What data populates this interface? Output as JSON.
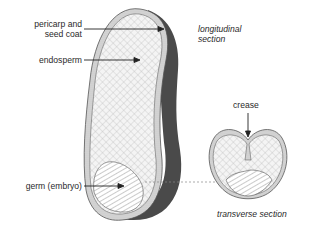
{
  "figure": {
    "labels": {
      "pericarp_line1": "pericarp and",
      "pericarp_line2": "seed coat",
      "endosperm": "endosperm",
      "germ": "germ (embryo)",
      "longitudinal_line1": "longitudinal",
      "longitudinal_line2": "section",
      "crease": "crease",
      "transverse": "transverse section"
    },
    "icons": {
      "endosperm_fill": "crosshatch-pattern",
      "germ_fill": "diagonal-hatch-pattern",
      "shadow": "dark-gray-shading"
    },
    "colors": {
      "outline": "#555555",
      "shadow": "#4a4a4a",
      "hatch": "#9a9a9a",
      "text": "#2a2a2a"
    }
  }
}
